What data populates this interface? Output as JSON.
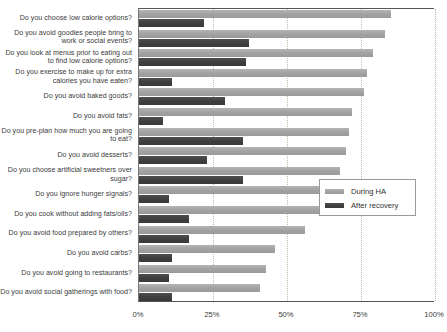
{
  "chart_data": {
    "type": "bar",
    "orientation": "horizontal",
    "title": "",
    "xlabel": "",
    "ylabel": "",
    "xlim": [
      0,
      100
    ],
    "xticks": [
      "0%",
      "25%",
      "50%",
      "75%",
      "100%"
    ],
    "xtick_values": [
      0,
      25,
      50,
      75,
      100
    ],
    "grid": true,
    "legend_position": "center-right",
    "categories": [
      "Do you choose low calorie options?",
      "Do you avoid goodies people bring to work or social events?",
      "Do you look at menus prior to eating out to find low calorie options?",
      "Do you exercise to make up for extra calories you have eaten?",
      "Do you avoid baked goods?",
      "Do you avoid fats?",
      "Do you pre-plan how much you are going to eat?",
      "Do you avoid desserts?",
      "Do you choose artificial sweetners over sugar?",
      "Do you ignore hunger signals?",
      "Do you cook without adding fats/oils?",
      "Do you avoid food prepared by others?",
      "Do you avoid carbs?",
      "Do you avoid going to restaurants?",
      "Do you avoid social gatherings with food?"
    ],
    "series": [
      {
        "name": "During HA",
        "color": "#a2a2a2",
        "values": [
          85,
          83,
          79,
          77,
          76,
          72,
          71,
          70,
          68,
          68,
          64,
          56,
          46,
          43,
          41
        ]
      },
      {
        "name": "After recovery",
        "color": "#3f3f3f",
        "values": [
          22,
          37,
          36,
          11,
          29,
          8,
          35,
          23,
          35,
          10,
          17,
          17,
          11,
          10,
          11
        ]
      }
    ]
  },
  "legend": {
    "items": [
      {
        "label": "During HA"
      },
      {
        "label": "After recovery"
      }
    ]
  }
}
